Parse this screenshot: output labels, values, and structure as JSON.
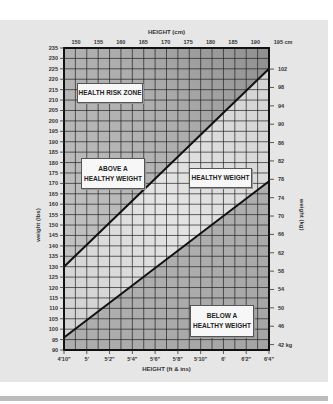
{
  "chart_data": {
    "type": "line",
    "title": "",
    "top_axis_label": "HEIGHT (cm)",
    "xlabel": "HEIGHT (ft & ins)",
    "ylabel": "weight (lbs)",
    "y2label": "weight (kg)",
    "x_ticks": [
      "4'10\"",
      "5'",
      "5'2\"",
      "5'4\"",
      "5'6\"",
      "5'8\"",
      "5'10\"",
      "6'",
      "6'2\"",
      "6'4\""
    ],
    "x_range_inches": [
      58,
      76
    ],
    "top_ticks_cm": [
      "150",
      "155",
      "160",
      "165",
      "170",
      "175",
      "180",
      "185",
      "190",
      "195 cm"
    ],
    "y_ticks_lbs": [
      235,
      230,
      225,
      220,
      215,
      210,
      205,
      200,
      195,
      190,
      185,
      180,
      175,
      170,
      165,
      160,
      155,
      150,
      145,
      140,
      135,
      130,
      125,
      120,
      115,
      110,
      105,
      100,
      95,
      90
    ],
    "ylim": [
      90,
      235
    ],
    "y2_ticks_kg": [
      "102",
      "98",
      "94",
      "90",
      "86",
      "82",
      "78",
      "74",
      "70",
      "66",
      "62",
      "58",
      "54",
      "50",
      "46",
      "42 kg"
    ],
    "grid": true,
    "series": [
      {
        "name": "Upper boundary of healthy weight",
        "x": [
          58,
          76
        ],
        "values": [
          130,
          225
        ]
      },
      {
        "name": "Lower boundary of healthy weight",
        "x": [
          58,
          76
        ],
        "values": [
          96,
          171
        ]
      }
    ],
    "zones": [
      {
        "label": "HEALTH RISK ZONE"
      },
      {
        "label": "ABOVE A HEALTHY WEIGHT"
      },
      {
        "label": "HEALTHY WEIGHT"
      },
      {
        "label": "BELOW A HEALTHY WEIGHT"
      }
    ]
  },
  "labels": {
    "top_axis_title": "HEIGHT (cm)",
    "bottom_axis_title": "HEIGHT (ft & ins)",
    "left_axis_title": "weight (lbs)",
    "right_axis_title": "weight (kg)",
    "zone_risk": "HEALTH RISK ZONE",
    "zone_above_1": "ABOVE A",
    "zone_above_2": "HEALTHY WEIGHT",
    "zone_healthy": "HEALTHY WEIGHT",
    "zone_below_1": "BELOW A",
    "zone_below_2": "HEALTHY WEIGHT"
  },
  "colors": {
    "outer_zone": "#a9a9a9",
    "healthy_zone": "#dcdcdc",
    "grid": "#222222",
    "line": "#111111",
    "background": "#e6e6e6"
  }
}
